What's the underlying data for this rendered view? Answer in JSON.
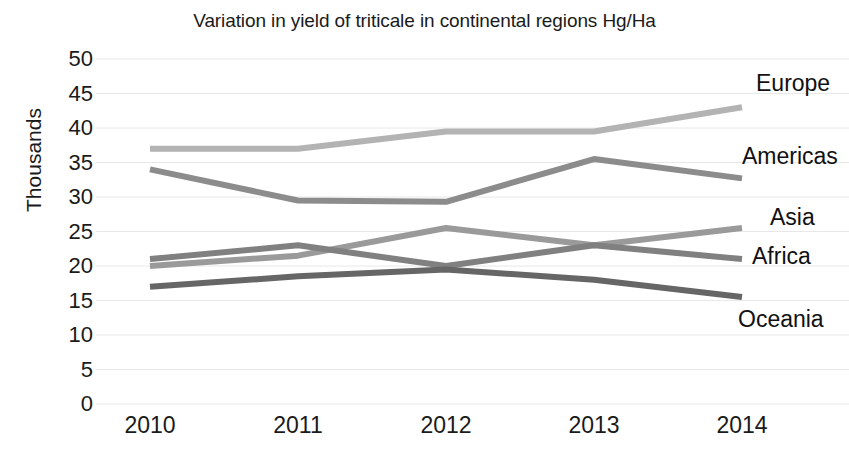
{
  "chart_data": {
    "type": "line",
    "title": "Variation in yield of triticale in continental regions Hg/Ha",
    "xlabel": "",
    "ylabel": "Thousands",
    "categories": [
      "2010",
      "2011",
      "2012",
      "2013",
      "2014"
    ],
    "ylim": [
      0,
      50
    ],
    "y_ticks": [
      "0",
      "5",
      "10",
      "15",
      "20",
      "25",
      "30",
      "35",
      "40",
      "45",
      "50"
    ],
    "grid": true,
    "legend_position": "right-inline-labels",
    "series": [
      {
        "name": "Europe",
        "values": [
          37,
          37,
          39.5,
          39.5,
          43
        ],
        "color": "#b3b3b3"
      },
      {
        "name": "Americas",
        "values": [
          34,
          29.5,
          29.3,
          35.5,
          32.7
        ],
        "color": "#8c8c8c"
      },
      {
        "name": "Asia",
        "values": [
          20,
          21.5,
          25.5,
          23,
          25.5
        ],
        "color": "#9a9a9a"
      },
      {
        "name": "Africa",
        "values": [
          21,
          23,
          20,
          23,
          21
        ],
        "color": "#808080"
      },
      {
        "name": "Oceania",
        "values": [
          17,
          18.5,
          19.5,
          18,
          15.5
        ],
        "color": "#666666"
      }
    ]
  },
  "series_labels": [
    {
      "text": "Europe",
      "left": 756,
      "top": 72
    },
    {
      "text": "Americas",
      "left": 742,
      "top": 145
    },
    {
      "text": "Asia",
      "left": 770,
      "top": 206
    },
    {
      "text": "Africa",
      "left": 752,
      "top": 245
    },
    {
      "text": "Oceania",
      "left": 738,
      "top": 308
    }
  ],
  "colors": {
    "gridline": "#e8e8e8",
    "text": "#1a1a1a",
    "background": "#ffffff"
  }
}
